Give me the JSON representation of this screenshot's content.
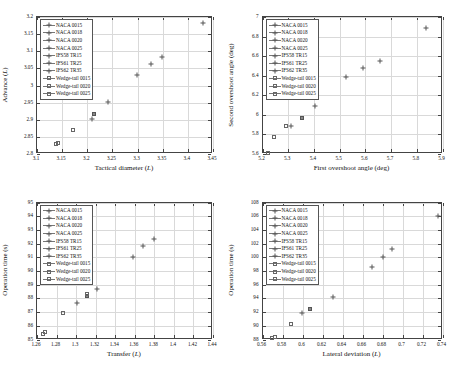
{
  "legend": {
    "entries": [
      {
        "label": "NACA 0015",
        "marker": "plus"
      },
      {
        "label": "NACA 0018",
        "marker": "plus"
      },
      {
        "label": "NACA 0020",
        "marker": "plus"
      },
      {
        "label": "NACA 0025",
        "marker": "plus"
      },
      {
        "label": "IFS58 TR15",
        "marker": "plus"
      },
      {
        "label": "IFS61 TR25",
        "marker": "plus"
      },
      {
        "label": "IFS62 TR35",
        "marker": "plus"
      },
      {
        "label": "Wedge-tail 0015",
        "marker": "square"
      },
      {
        "label": "Wedge-tail 0020",
        "marker": "square"
      },
      {
        "label": "Wedge-tail 0025",
        "marker": "square"
      }
    ]
  },
  "chart_data": [
    {
      "id": "top-left",
      "type": "scatter",
      "title": "",
      "xlabel": "Tactical diameter (L)",
      "ylabel": "Advance (L)",
      "xlim": [
        3.1,
        3.45
      ],
      "ylim": [
        2.8,
        3.2
      ],
      "xticks": [
        "3.1",
        "3.15",
        "3.2",
        "3.25",
        "3.3",
        "3.35",
        "3.4",
        "3.45"
      ],
      "yticks": [
        "2.8",
        "2.85",
        "2.9",
        "2.95",
        "3",
        "3.05",
        "3.1",
        "3.15",
        "3.2"
      ],
      "xtickvals": [
        3.1,
        3.15,
        3.2,
        3.25,
        3.3,
        3.35,
        3.4,
        3.45
      ],
      "ytickvals": [
        2.8,
        2.85,
        2.9,
        2.95,
        3.0,
        3.05,
        3.1,
        3.15,
        3.2
      ],
      "grid": true,
      "legend_position": "top-left",
      "points": [
        {
          "series": "NACA 0015",
          "marker": "plus",
          "x": 3.43,
          "y": 3.183
        },
        {
          "series": "NACA 0018",
          "marker": "plus",
          "x": 3.348,
          "y": 3.082
        },
        {
          "series": "NACA 0020",
          "marker": "plus",
          "x": 3.327,
          "y": 3.062
        },
        {
          "series": "NACA 0025",
          "marker": "plus",
          "x": 3.299,
          "y": 3.031
        },
        {
          "series": "IFS58 TR15",
          "marker": "plus",
          "x": 3.241,
          "y": 2.951
        },
        {
          "series": "IFS61 TR25",
          "marker": "squarefill",
          "x": 3.214,
          "y": 2.918
        },
        {
          "series": "IFS62 TR35",
          "marker": "plus",
          "x": 3.209,
          "y": 2.901
        },
        {
          "series": "Wedge-tail 0015",
          "marker": "square",
          "x": 3.171,
          "y": 2.871
        },
        {
          "series": "Wedge-tail 0020",
          "marker": "square",
          "x": 3.141,
          "y": 2.831
        },
        {
          "series": "Wedge-tail 0025",
          "marker": "square",
          "x": 3.138,
          "y": 2.829
        }
      ]
    },
    {
      "id": "top-right",
      "type": "scatter",
      "title": "",
      "xlabel": "First overshoot angle (deg)",
      "ylabel": "Second overshoot angle (deg)",
      "xlim": [
        5.2,
        5.9
      ],
      "ylim": [
        5.6,
        7.0
      ],
      "xticks": [
        "5.2",
        "5.3",
        "5.4",
        "5.5",
        "5.6",
        "5.7",
        "5.8",
        "5.9"
      ],
      "yticks": [
        "5.6",
        "5.8",
        "6",
        "6.2",
        "6.4",
        "6.6",
        "6.8",
        "7"
      ],
      "xtickvals": [
        5.2,
        5.3,
        5.4,
        5.5,
        5.6,
        5.7,
        5.8,
        5.9
      ],
      "ytickvals": [
        5.6,
        5.8,
        6.0,
        6.2,
        6.4,
        6.6,
        6.8,
        7.0
      ],
      "grid": true,
      "legend_position": "top-left",
      "points": [
        {
          "series": "NACA 0015",
          "marker": "plus",
          "x": 5.835,
          "y": 6.885
        },
        {
          "series": "NACA 0018",
          "marker": "plus",
          "x": 5.655,
          "y": 6.555
        },
        {
          "series": "NACA 0020",
          "marker": "plus",
          "x": 5.592,
          "y": 6.475
        },
        {
          "series": "NACA 0025",
          "marker": "plus",
          "x": 5.525,
          "y": 6.385
        },
        {
          "series": "IFS58 TR15",
          "marker": "plus",
          "x": 5.406,
          "y": 6.086
        },
        {
          "series": "IFS61 TR25",
          "marker": "squarefill",
          "x": 5.353,
          "y": 5.965
        },
        {
          "series": "IFS62 TR35",
          "marker": "plus",
          "x": 5.312,
          "y": 5.886
        },
        {
          "series": "Wedge-tail 0015",
          "marker": "square",
          "x": 5.293,
          "y": 5.884
        },
        {
          "series": "Wedge-tail 0020",
          "marker": "square",
          "x": 5.243,
          "y": 5.772
        },
        {
          "series": "Wedge-tail 0025",
          "marker": "square",
          "x": 5.221,
          "y": 5.608
        }
      ]
    },
    {
      "id": "bottom-left",
      "type": "scatter",
      "title": "",
      "xlabel": "Transfer (L)",
      "ylabel": "Operation time (s)",
      "xlim": [
        1.26,
        1.44
      ],
      "ylim": [
        85,
        95
      ],
      "xticks": [
        "1.26",
        "1.28",
        "1.3",
        "1.32",
        "1.34",
        "1.36",
        "1.38",
        "1.4",
        "1.42",
        "1.44"
      ],
      "yticks": [
        "85",
        "86",
        "87",
        "88",
        "89",
        "90",
        "91",
        "92",
        "93",
        "94",
        "95"
      ],
      "xtickvals": [
        1.26,
        1.28,
        1.3,
        1.32,
        1.34,
        1.36,
        1.38,
        1.4,
        1.42,
        1.44
      ],
      "ytickvals": [
        85,
        86,
        87,
        88,
        89,
        90,
        91,
        92,
        93,
        94,
        95
      ],
      "grid": true,
      "legend_position": "top-left",
      "points": [
        {
          "series": "NACA 0015",
          "marker": "plus",
          "x": 1.38,
          "y": 92.35
        },
        {
          "series": "NACA 0018",
          "marker": "plus",
          "x": 1.368,
          "y": 91.85
        },
        {
          "series": "NACA 0020",
          "marker": "plus",
          "x": 1.358,
          "y": 91.0
        },
        {
          "series": "NACA 0025",
          "marker": "plus",
          "x": 1.321,
          "y": 88.7
        },
        {
          "series": "IFS58 TR15",
          "marker": "squarefill",
          "x": 1.311,
          "y": 88.2
        },
        {
          "series": "IFS61 TR25",
          "marker": "square",
          "x": 1.311,
          "y": 88.3
        },
        {
          "series": "IFS62 TR35",
          "marker": "plus",
          "x": 1.301,
          "y": 87.65
        },
        {
          "series": "Wedge-tail 0015",
          "marker": "square",
          "x": 1.287,
          "y": 86.9
        },
        {
          "series": "Wedge-tail 0020",
          "marker": "square",
          "x": 1.268,
          "y": 85.55
        },
        {
          "series": "Wedge-tail 0025",
          "marker": "square",
          "x": 1.266,
          "y": 85.4
        }
      ]
    },
    {
      "id": "bottom-right",
      "type": "scatter",
      "title": "",
      "xlabel": "Lateral deviation (L)",
      "ylabel": "Operation time (s)",
      "xlim": [
        0.56,
        0.74
      ],
      "ylim": [
        88,
        108
      ],
      "xticks": [
        "0.56",
        "0.58",
        "0.6",
        "0.62",
        "0.64",
        "0.66",
        "0.68",
        "0.7",
        "0.72",
        "0.74"
      ],
      "yticks": [
        "88",
        "90",
        "92",
        "94",
        "96",
        "98",
        "100",
        "102",
        "104",
        "106",
        "108"
      ],
      "xtickvals": [
        0.56,
        0.58,
        0.6,
        0.62,
        0.64,
        0.66,
        0.68,
        0.7,
        0.72,
        0.74
      ],
      "ytickvals": [
        88,
        90,
        92,
        94,
        96,
        98,
        100,
        102,
        104,
        106,
        108
      ],
      "grid": true,
      "legend_position": "top-left",
      "points": [
        {
          "series": "NACA 0015",
          "marker": "plus",
          "x": 0.735,
          "y": 106.1
        },
        {
          "series": "NACA 0018",
          "marker": "plus",
          "x": 0.689,
          "y": 101.2
        },
        {
          "series": "NACA 0020",
          "marker": "plus",
          "x": 0.68,
          "y": 100.0
        },
        {
          "series": "NACA 0025",
          "marker": "plus",
          "x": 0.669,
          "y": 98.6
        },
        {
          "series": "IFS58 TR15",
          "marker": "plus",
          "x": 0.63,
          "y": 94.2
        },
        {
          "series": "IFS61 TR25",
          "marker": "squarefill",
          "x": 0.607,
          "y": 92.5
        },
        {
          "series": "IFS62 TR35",
          "marker": "plus",
          "x": 0.599,
          "y": 91.8
        },
        {
          "series": "Wedge-tail 0015",
          "marker": "square",
          "x": 0.588,
          "y": 90.2
        },
        {
          "series": "Wedge-tail 0020",
          "marker": "square",
          "x": 0.572,
          "y": 88.4
        },
        {
          "series": "Wedge-tail 0025",
          "marker": "square",
          "x": 0.569,
          "y": 88.15
        }
      ]
    }
  ]
}
